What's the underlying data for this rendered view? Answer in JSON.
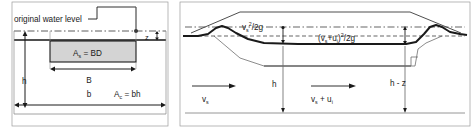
{
  "figure": {
    "panels": [
      {
        "id": "left",
        "name": "channel-cross-section-with-blockage",
        "labels": {
          "original_water_level": "original water level",
          "blockage_area": "A",
          "blockage_area_sub": "s",
          "blockage_area_eq": " = BD",
          "channel_area": "A",
          "channel_area_sub": "c",
          "channel_area_eq": " = bh",
          "depth_h": "h",
          "width_B": "B",
          "width_b": "b",
          "rise_z": "z"
        }
      },
      {
        "id": "right",
        "name": "energy-head-longitudinal-section",
        "labels": {
          "head_upstream_v": "v",
          "head_upstream_sub": "s",
          "head_upstream_sup": "2",
          "head_upstream_tail": "/2g",
          "head_downstream_open": "(v",
          "head_downstream_sub1": "s",
          "head_downstream_plus": "+u",
          "head_downstream_sub2": "i",
          "head_downstream_close": ")",
          "head_downstream_sup": "2",
          "head_downstream_tail": "/2g",
          "depth_h": "h",
          "depth_h_minus_z": "h - z",
          "velocity_upstream": "v",
          "velocity_upstream_sub": "s",
          "velocity_downstream_v": "v",
          "velocity_downstream_sub1": "s",
          "velocity_downstream_plus": " + u",
          "velocity_downstream_sub2": "i"
        }
      }
    ],
    "colors": {
      "line": "#1a1a1a",
      "water_surface": "#555555",
      "blockage_fill": "#d4d4d4",
      "blockage_stroke": "#1a1a1a",
      "dash": "#4a4a4a",
      "frame": "#8a8a8a",
      "thin": "#6e6e6e"
    }
  }
}
